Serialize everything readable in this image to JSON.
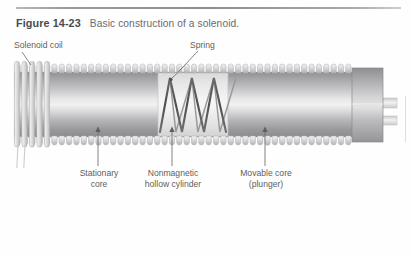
{
  "figure": {
    "number": "Figure 14-23",
    "caption": "Basic construction of a solenoid."
  },
  "labels": {
    "solenoid_coil": "Solenoid coil",
    "spring": "Spring",
    "stationary_core": "Stationary\ncore",
    "stationary_core_line1": "Stationary",
    "stationary_core_line2": "core",
    "nonmagnetic_line1": "Nonmagnetic",
    "nonmagnetic_line2": "hollow cylinder",
    "movable_core_line1": "Movable core",
    "movable_core_line2": "(plunger)"
  },
  "colors": {
    "rule": "#9b9b9d",
    "caption_bold": "#4a4a4c",
    "caption_text": "#6a6a6c",
    "label_text": "#5e5e60",
    "metal_dark": "#8d8d8f",
    "metal_light": "#eaeaea",
    "metal_mid": "#b4b4b6",
    "coil_outline": "#bdbdbf",
    "spring_dark": "#59595b",
    "leader_line": "#6e6e70",
    "background": "#fefefe"
  },
  "geometry": {
    "body_left": 14,
    "body_right": 352,
    "body_top": 72,
    "body_bottom": 137,
    "coil_tooth_count": 46,
    "spring_coil_turns": 3,
    "plunger_cap_left": 352,
    "plunger_cap_right": 383,
    "shaft_right": 397
  },
  "leaders": {
    "solenoid_coil": "diagonal-down-right",
    "spring": "curve-down-left",
    "stationary_core": "vertical-arrow-up",
    "nonmagnetic": "vertical-arrow-up",
    "movable_core": "vertical-arrow-up"
  }
}
